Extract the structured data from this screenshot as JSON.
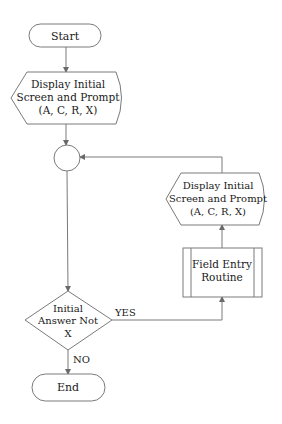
{
  "diagram": {
    "type": "flowchart",
    "nodes": {
      "start": {
        "shape": "terminator",
        "label": "Start"
      },
      "display_1": {
        "shape": "display",
        "lines": [
          "Display Initial",
          "Screen and Prompt",
          "(A, C, R, X)"
        ]
      },
      "connector": {
        "shape": "connector-circle",
        "label": ""
      },
      "decision": {
        "shape": "decision",
        "lines": [
          "Initial",
          "Answer Not",
          "X"
        ]
      },
      "end": {
        "shape": "terminator",
        "label": "End"
      },
      "field_entry": {
        "shape": "predefined-process",
        "lines": [
          "Field Entry",
          "Routine"
        ]
      },
      "display_2": {
        "shape": "display",
        "lines": [
          "Display Initial",
          "Screen and Prompt",
          "(A, C, R, X)"
        ]
      }
    },
    "edges": {
      "start_to_display_1": {
        "from": "start",
        "to": "display_1",
        "label": ""
      },
      "display_1_to_connector": {
        "from": "display_1",
        "to": "connector",
        "label": ""
      },
      "connector_to_decision": {
        "from": "connector",
        "to": "decision",
        "label": ""
      },
      "decision_yes": {
        "from": "decision",
        "to": "field_entry",
        "label": "YES"
      },
      "decision_no": {
        "from": "decision",
        "to": "end",
        "label": "NO"
      },
      "field_entry_to_display_2": {
        "from": "field_entry",
        "to": "display_2",
        "label": ""
      },
      "display_2_to_connector": {
        "from": "display_2",
        "to": "connector",
        "label": ""
      }
    },
    "colors": {
      "stroke": "#7a7a7a",
      "text": "#1a1a1a",
      "background": "#ffffff"
    }
  }
}
